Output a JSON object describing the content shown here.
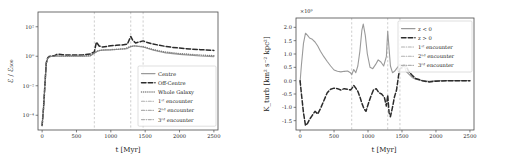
{
  "figure": {
    "panels": [
      "left",
      "right"
    ],
    "background": "#ffffff"
  },
  "colors": {
    "solid_grey": "#9a9a9a",
    "dashed_dark": "#2b2b2b",
    "dotted_grey": "#7d7d7d",
    "vline": "#b9b9b9",
    "axis": "#4a4a4a",
    "text": "#1a1a1a"
  },
  "left_panel": {
    "xlabel": "t [Myr]",
    "ylabel": "ℰ / ℰ₅₀₀",
    "xticks": [
      "0",
      "500",
      "1000",
      "1500",
      "2000",
      "2500"
    ],
    "yticks": [
      "10²",
      "10⁰",
      "10⁻²",
      "10⁻⁴"
    ],
    "legend": [
      {
        "label": "Centre",
        "style": "solid",
        "color": "#9a9a9a"
      },
      {
        "label": "Off-Centre",
        "style": "dashed",
        "color": "#2b2b2b"
      },
      {
        "label": "Whole Galaxy",
        "style": "dotted",
        "color": "#7d7d7d"
      },
      {
        "label": "1ˢᵗ encounter",
        "style": "dashdot",
        "color": "#b0b0b0"
      },
      {
        "label": "2ⁿᵈ encounter",
        "style": "dashdot",
        "color": "#b0b0b0"
      },
      {
        "label": "3ʳᵈ encounter",
        "style": "dashdot",
        "color": "#b0b0b0"
      }
    ]
  },
  "right_panel": {
    "xlabel": "t [Myr]",
    "ylabel": "K_turb [km² s⁻² kpc²]",
    "exponent": "×10⁹",
    "xticks": [
      "0",
      "500",
      "1000",
      "1500",
      "2000",
      "2500"
    ],
    "yticks": [
      "2.0",
      "1.5",
      "1.0",
      "0.5",
      "0.0",
      "-0.5",
      "-1.0",
      "-1.5"
    ],
    "legend": [
      {
        "label": "z < 0",
        "style": "solid",
        "color": "#9a9a9a"
      },
      {
        "label": "z > 0",
        "style": "dashed",
        "color": "#2b2b2b"
      },
      {
        "label": "1ˢᵗ encounter",
        "style": "dashdot",
        "color": "#b0b0b0"
      },
      {
        "label": "2ⁿᵈ encounter",
        "style": "dashdot",
        "color": "#b0b0b0"
      },
      {
        "label": "3ʳᵈ encounter",
        "style": "dashdot",
        "color": "#b0b0b0"
      }
    ]
  },
  "chart_data": [
    {
      "type": "line",
      "panel": "left",
      "title": "",
      "xlabel": "t [Myr]",
      "ylabel": "E / E_500",
      "yscale": "log",
      "xlim": [
        -60,
        2560
      ],
      "ylim": [
        1e-05,
        1000
      ],
      "grid": false,
      "legend_position": "lower-right",
      "annotations": [
        {
          "type": "vline",
          "label": "1st encounter",
          "x": 760
        },
        {
          "type": "vline",
          "label": "2nd encounter",
          "x": 1290
        },
        {
          "type": "vline",
          "label": "3rd encounter",
          "x": 1470
        }
      ],
      "series": [
        {
          "name": "Centre",
          "style": "solid",
          "color": "#9a9a9a",
          "x": [
            0,
            20,
            40,
            60,
            80,
            100,
            140,
            180,
            220,
            300,
            400,
            500,
            600,
            700,
            760,
            800,
            860,
            920,
            1000,
            1080,
            1160,
            1240,
            1290,
            1340,
            1400,
            1470,
            1540,
            1620,
            1700,
            1800,
            1900,
            2000,
            2150,
            2300,
            2500
          ],
          "y": [
            2e-05,
            0.0003,
            0.01,
            0.3,
            0.7,
            0.9,
            1.0,
            1.0,
            1.05,
            1.0,
            1.0,
            1.0,
            1.0,
            1.05,
            1.6,
            2.2,
            2.6,
            2.6,
            2.7,
            2.9,
            3.1,
            3.3,
            4.5,
            5.2,
            4.6,
            4.2,
            3.4,
            2.6,
            2.1,
            1.7,
            1.5,
            1.35,
            1.2,
            1.05,
            0.95
          ]
        },
        {
          "name": "Off-Centre",
          "style": "dashed",
          "color": "#2b2b2b",
          "x": [
            0,
            20,
            40,
            60,
            80,
            100,
            140,
            180,
            220,
            300,
            400,
            500,
            600,
            700,
            760,
            790,
            830,
            880,
            940,
            1000,
            1080,
            1160,
            1240,
            1290,
            1320,
            1360,
            1420,
            1470,
            1520,
            1600,
            1700,
            1800,
            1900,
            2000,
            2150,
            2300,
            2500
          ],
          "y": [
            2e-05,
            0.0003,
            0.01,
            0.35,
            0.75,
            0.95,
            1.05,
            1.1,
            1.4,
            1.25,
            1.2,
            1.2,
            1.25,
            1.4,
            2.0,
            9.0,
            5.0,
            4.2,
            4.6,
            5.2,
            5.5,
            5.8,
            6.5,
            22.0,
            12.0,
            8.0,
            9.5,
            11.0,
            9.0,
            7.0,
            5.6,
            4.6,
            4.0,
            3.6,
            3.1,
            2.8,
            2.5
          ]
        },
        {
          "name": "Whole Galaxy",
          "style": "dotted",
          "color": "#7d7d7d",
          "x": [
            0,
            20,
            40,
            60,
            80,
            100,
            140,
            180,
            220,
            300,
            400,
            500,
            600,
            700,
            760,
            820,
            900,
            1000,
            1100,
            1200,
            1290,
            1360,
            1420,
            1470,
            1540,
            1620,
            1700,
            1800,
            1900,
            2000,
            2150,
            2300,
            2500
          ],
          "y": [
            2e-05,
            0.0003,
            0.01,
            0.32,
            0.72,
            0.92,
            1.02,
            1.02,
            1.08,
            1.02,
            1.02,
            1.02,
            1.05,
            1.1,
            1.7,
            2.4,
            2.7,
            2.8,
            3.0,
            3.2,
            4.7,
            5.0,
            4.7,
            4.4,
            3.6,
            2.8,
            2.3,
            1.9,
            1.7,
            1.5,
            1.35,
            1.2,
            1.1
          ]
        }
      ]
    },
    {
      "type": "line",
      "panel": "right",
      "title": "",
      "xlabel": "t [Myr]",
      "ylabel": "K_turb [km^2 s^-2 kpc^2]",
      "yscale": "linear",
      "y_exponent": 1000000000.0,
      "xlim": [
        -60,
        2560
      ],
      "ylim": [
        -1.85,
        2.35
      ],
      "grid": false,
      "legend_position": "upper-right",
      "annotations": [
        {
          "type": "vline",
          "label": "1st encounter",
          "x": 760
        },
        {
          "type": "vline",
          "label": "2nd encounter",
          "x": 1290
        },
        {
          "type": "vline",
          "label": "3rd encounter",
          "x": 1470
        }
      ],
      "series": [
        {
          "name": "z < 0",
          "style": "solid",
          "color": "#9a9a9a",
          "x": [
            0,
            20,
            50,
            80,
            110,
            140,
            180,
            220,
            260,
            300,
            350,
            400,
            450,
            500,
            550,
            600,
            650,
            700,
            740,
            760,
            790,
            820,
            850,
            880,
            910,
            930,
            960,
            990,
            1030,
            1070,
            1110,
            1150,
            1190,
            1230,
            1270,
            1290,
            1310,
            1330,
            1360,
            1390,
            1420,
            1450,
            1470,
            1500,
            1530,
            1560,
            1600,
            1650,
            1700,
            1800,
            1900,
            2000,
            2150,
            2300,
            2500
          ],
          "y": [
            -0.05,
            0.6,
            1.4,
            1.78,
            1.7,
            1.6,
            1.55,
            1.45,
            1.3,
            1.1,
            0.9,
            0.72,
            0.55,
            0.4,
            0.35,
            0.33,
            0.35,
            0.36,
            0.3,
            0.22,
            0.42,
            0.3,
            0.55,
            1.1,
            1.9,
            2.12,
            1.7,
            1.0,
            0.5,
            0.45,
            0.6,
            0.78,
            0.7,
            0.55,
            0.9,
            1.85,
            1.2,
            0.55,
            0.3,
            0.35,
            0.45,
            0.55,
            0.62,
            0.45,
            0.6,
            0.35,
            0.25,
            0.12,
            0.05,
            0.0,
            -0.02,
            0.0,
            0.0,
            0.0,
            0.0
          ]
        },
        {
          "name": "z > 0",
          "style": "dashed",
          "color": "#2b2b2b",
          "x": [
            0,
            20,
            50,
            80,
            110,
            140,
            180,
            220,
            260,
            300,
            350,
            400,
            450,
            500,
            550,
            600,
            650,
            700,
            740,
            760,
            790,
            820,
            850,
            880,
            910,
            940,
            970,
            1000,
            1040,
            1080,
            1120,
            1160,
            1200,
            1240,
            1270,
            1290,
            1310,
            1330,
            1360,
            1390,
            1420,
            1450,
            1470,
            1500,
            1530,
            1560,
            1600,
            1650,
            1700,
            1800,
            1900,
            2000,
            2150,
            2300,
            2500
          ],
          "y": [
            0.0,
            -0.5,
            -1.2,
            -1.68,
            -1.6,
            -1.45,
            -1.3,
            -1.15,
            -1.25,
            -1.05,
            -0.75,
            -0.45,
            -0.32,
            -0.28,
            -0.3,
            -0.35,
            -0.3,
            -0.32,
            -0.35,
            -0.3,
            -0.18,
            -0.28,
            -0.4,
            -0.6,
            -0.85,
            -1.05,
            -1.15,
            -0.9,
            -0.6,
            -0.35,
            -0.3,
            -0.45,
            -0.5,
            -0.62,
            -0.95,
            -0.55,
            -1.2,
            -1.35,
            -1.0,
            -0.6,
            -0.35,
            0.2,
            0.45,
            0.5,
            0.6,
            0.55,
            0.35,
            0.2,
            0.08,
            0.0,
            -0.05,
            -0.02,
            0.0,
            0.0,
            0.0
          ]
        }
      ]
    }
  ]
}
